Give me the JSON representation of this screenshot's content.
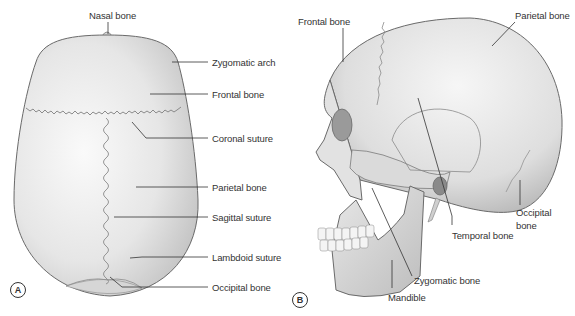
{
  "figure": {
    "panels": [
      {
        "id": "A",
        "view": "superior view of skull",
        "labels": [
          "Nasal bone",
          "Zygomatic arch",
          "Frontal bone",
          "Coronal suture",
          "Parietal bone",
          "Sagittal suture",
          "Lambdoid suture",
          "Occipital bone"
        ]
      },
      {
        "id": "B",
        "view": "lateral view of skull",
        "labels": [
          "Frontal bone",
          "Parietal bone",
          "Occipital bone",
          "Temporal bone",
          "Zygomatic bone",
          "Mandible"
        ]
      }
    ]
  },
  "panelA": {
    "tag": "A",
    "nasal": "Nasal bone",
    "zygomatic_arch": "Zygomatic arch",
    "frontal": "Frontal bone",
    "coronal": "Coronal suture",
    "parietal": "Parietal bone",
    "sagittal": "Sagittal suture",
    "lambdoid": "Lambdoid suture",
    "occipital": "Occipital bone"
  },
  "panelB": {
    "tag": "B",
    "frontal": "Frontal bone",
    "parietal": "Parietal bone",
    "occipital_1": "Occipital",
    "occipital_2": "bone",
    "temporal": "Temporal bone",
    "zygomatic": "Zygomatic bone",
    "mandible": "Mandible"
  },
  "colors": {
    "bone_fill": "#e9e9e9",
    "bone_shadow": "#b8b8b8",
    "outline": "#6a6a6a",
    "leader": "#333333",
    "text": "#333333"
  }
}
